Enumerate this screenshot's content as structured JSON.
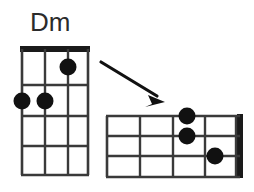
{
  "figure": {
    "title": "Dm",
    "background_color": "#ffffff",
    "ink_color": "#1a1a1a",
    "description_type": "chord-diagram-pair"
  },
  "chord_diagram_vertical": {
    "name": "Dm",
    "orientation": "vertical",
    "strings": 4,
    "frets": 4,
    "nut": "top-thick-bar",
    "geometry": {
      "x": 21,
      "y": 47,
      "width": 68,
      "height": 128,
      "nut_thickness": 6
    },
    "dots": [
      {
        "string": 4,
        "fret": 1,
        "cx": 68,
        "cy": 67,
        "r": 8
      },
      {
        "string": 1,
        "fret": 2,
        "cx": 22,
        "cy": 101,
        "r": 8
      },
      {
        "string": 2,
        "fret": 2,
        "cx": 45,
        "cy": 101,
        "r": 8
      }
    ]
  },
  "chord_diagram_horizontal": {
    "name": "Dm",
    "orientation": "horizontal",
    "strings": 4,
    "frets": 4,
    "nut": "right-thick-bar",
    "geometry": {
      "x": 106,
      "y": 115,
      "width": 136,
      "height": 62,
      "nut_thickness": 6
    },
    "dots": [
      {
        "string": 4,
        "fret": 1,
        "cx": 187,
        "cy": 116,
        "r": 8
      },
      {
        "string": 3,
        "fret": 2,
        "cx": 187,
        "cy": 136,
        "r": 8
      },
      {
        "string": 2,
        "fret": 1,
        "cx": 215,
        "cy": 156,
        "r": 8
      }
    ]
  },
  "arrow": {
    "label": "rotation-arrow",
    "from": {
      "x": 101,
      "y": 62
    },
    "to": {
      "x": 164,
      "y": 101
    },
    "stroke_width": 3,
    "head_size": 11
  }
}
